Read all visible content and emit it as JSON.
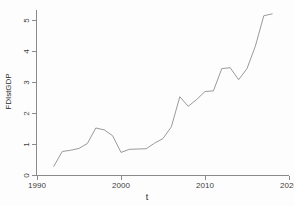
{
  "chart_data": {
    "type": "line",
    "title": "",
    "xlabel": "t",
    "ylabel": "FDIstGDP",
    "xlim": [
      1990,
      2020
    ],
    "ylim": [
      0,
      5.4
    ],
    "xticks": [
      1990,
      2000,
      2010,
      2020
    ],
    "yticks": [
      0,
      1,
      2,
      3,
      4,
      5
    ],
    "grid": false,
    "legend": null,
    "line_color": "#9a9a9a",
    "series": [
      {
        "name": "FDIstGDP",
        "x": [
          1992,
          1993,
          1994,
          1995,
          1996,
          1997,
          1998,
          1999,
          2000,
          2001,
          2002,
          2003,
          2004,
          2005,
          2006,
          2007,
          2008,
          2009,
          2010,
          2011,
          2012,
          2013,
          2014,
          2015,
          2016,
          2017,
          2018
        ],
        "values": [
          0.28,
          0.76,
          0.8,
          0.86,
          1.02,
          1.52,
          1.46,
          1.27,
          0.73,
          0.83,
          0.84,
          0.85,
          1.03,
          1.18,
          1.56,
          2.53,
          2.22,
          2.44,
          2.7,
          2.72,
          3.44,
          3.47,
          3.08,
          3.44,
          4.17,
          5.15,
          5.21
        ]
      }
    ]
  },
  "axes": {
    "ytick_labels": [
      "0",
      "1",
      "2",
      "3",
      "4",
      "5"
    ],
    "xtick_labels": [
      "1990",
      "2000",
      "2010",
      "2020"
    ],
    "y_title": "FDIstGDP",
    "x_title": "t"
  }
}
